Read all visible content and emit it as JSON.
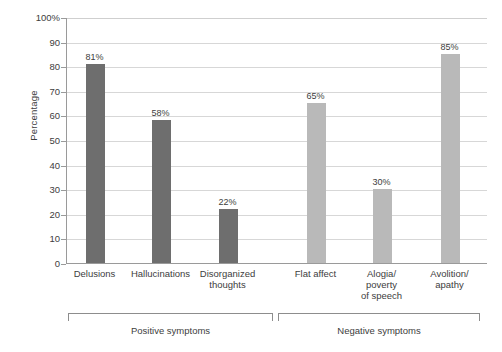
{
  "chart_data": {
    "type": "bar",
    "title": "",
    "xlabel": "",
    "ylabel": "Percentage",
    "ylim": [
      0,
      100
    ],
    "grid": true,
    "legend": "none",
    "categories": [
      "Delusions",
      "Hallucinations",
      "Disorganized thoughts",
      "Flat affect",
      "Alogia/ poverty of speech",
      "Avolition/ apathy"
    ],
    "values": [
      81,
      58,
      22,
      65,
      30,
      85
    ],
    "value_labels": [
      "81%",
      "58%",
      "22%",
      "65%",
      "30%",
      "85%"
    ],
    "ytick_labels": [
      "100%",
      "90",
      "80",
      "70",
      "60",
      "50",
      "40",
      "30",
      "20",
      "10",
      "0"
    ],
    "ytick_values": [
      100,
      90,
      80,
      70,
      60,
      50,
      40,
      30,
      20,
      10,
      0
    ],
    "bar_colors": [
      "#6e6e6e",
      "#6e6e6e",
      "#6e6e6e",
      "#b9b9b9",
      "#b9b9b9",
      "#b9b9b9"
    ],
    "groups": [
      {
        "label": "Positive symptoms",
        "categories": [
          "Delusions",
          "Hallucinations",
          "Disorganized thoughts"
        ],
        "color": "#6e6e6e"
      },
      {
        "label": "Negative symptoms",
        "categories": [
          "Flat affect",
          "Alogia/ poverty of speech",
          "Avolition/ apathy"
        ],
        "color": "#b9b9b9"
      }
    ]
  },
  "axis": {
    "y_title": "Percentage"
  },
  "category_label_lines": [
    [
      "Delusions"
    ],
    [
      "Hallucinations"
    ],
    [
      "Disorganized",
      "thoughts"
    ],
    [
      "Flat affect"
    ],
    [
      "Alogia/",
      "poverty",
      "of speech"
    ],
    [
      "Avolition/",
      "apathy"
    ]
  ],
  "ticks": [
    {
      "label": "100%",
      "value": 100
    },
    {
      "label": "90",
      "value": 90
    },
    {
      "label": "80",
      "value": 80
    },
    {
      "label": "70",
      "value": 70
    },
    {
      "label": "60",
      "value": 60
    },
    {
      "label": "50",
      "value": 50
    },
    {
      "label": "40",
      "value": 40
    },
    {
      "label": "30",
      "value": 30
    },
    {
      "label": "20",
      "value": 20
    },
    {
      "label": "10",
      "value": 10
    },
    {
      "label": "0",
      "value": 0
    }
  ],
  "bars": [
    {
      "label": "Delusions",
      "value": 81,
      "value_label": "81%",
      "color": "#6e6e6e",
      "x": 85
    },
    {
      "label": "Hallucinations",
      "value": 58,
      "value_label": "58%",
      "color": "#6e6e6e",
      "x": 151
    },
    {
      "label": "Disorganized thoughts",
      "value": 22,
      "value_label": "22%",
      "color": "#6e6e6e",
      "x": 218
    },
    {
      "label": "Flat affect",
      "value": 65,
      "value_label": "65%",
      "color": "#b9b9b9",
      "x": 306
    },
    {
      "label": "Alogia/ poverty of speech",
      "value": 30,
      "value_label": "30%",
      "color": "#b9b9b9",
      "x": 372
    },
    {
      "label": "Avolition/ apathy",
      "value": 85,
      "value_label": "85%",
      "color": "#b9b9b9",
      "x": 440
    }
  ],
  "brackets": [
    {
      "label": "Positive symptoms",
      "left": 68,
      "width": 205
    },
    {
      "label": "Negative symptoms",
      "left": 278,
      "width": 202
    }
  ]
}
